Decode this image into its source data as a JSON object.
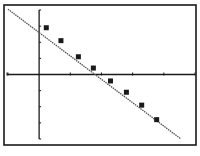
{
  "chart_data": {
    "type": "scatter",
    "title": "",
    "xlabel": "",
    "ylabel": "",
    "xlim": [
      -1.03,
      5.0
    ],
    "ylim": [
      -4.0,
      4.0
    ],
    "xscl": 1,
    "yscl": 1,
    "grid": false,
    "legend": "none",
    "series": [
      {
        "name": "data",
        "marker": "square",
        "x": [
          0.23,
          0.7,
          1.26,
          1.74,
          2.29,
          2.8,
          3.29,
          3.77
        ],
        "y": [
          2.9,
          2.1,
          1.1,
          0.4,
          -0.4,
          -1.1,
          -1.9,
          -2.8
        ]
      }
    ],
    "regression_line": {
      "name": "fit",
      "slope": -1.45,
      "intercept": 2.6,
      "x_range": [
        -1.0,
        4.55
      ]
    }
  },
  "colors": {
    "ink": "#1a1a1a",
    "background": "#ffffff",
    "line": "#555555"
  }
}
